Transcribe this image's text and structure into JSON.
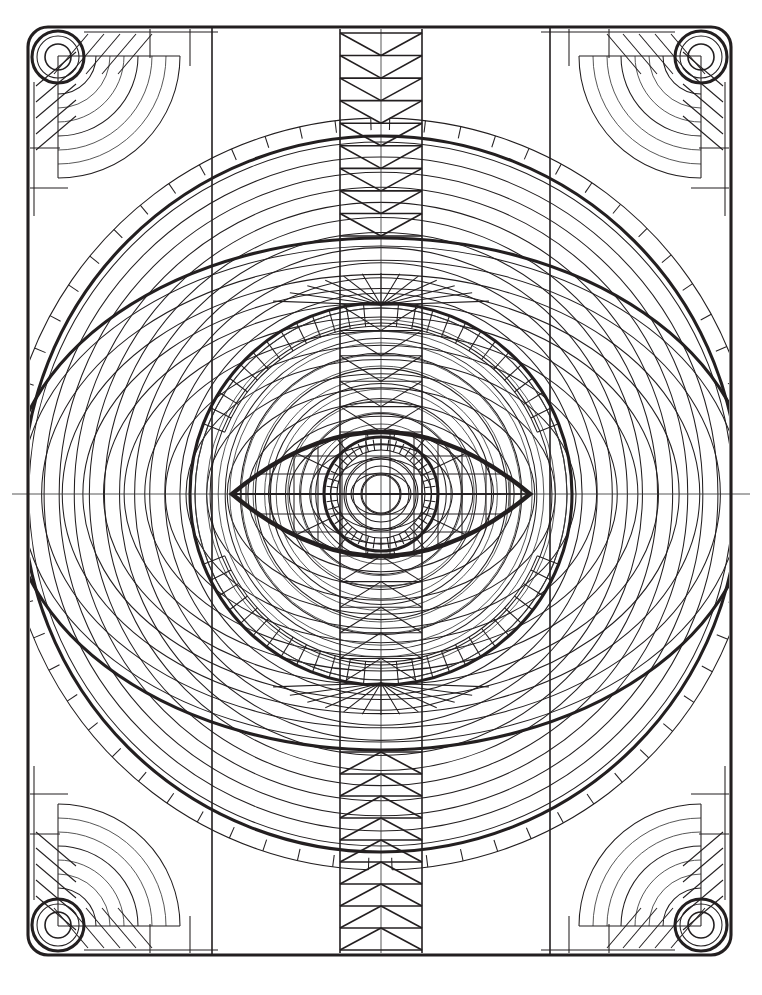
{
  "artwork": {
    "title": "Symmetric Eye Mandala Line Drawing",
    "kind": "coloring-page-line-art",
    "canvas": {
      "width": 762,
      "height": 995,
      "background": "#ffffff"
    },
    "ink": {
      "line_color": "#231f20",
      "fill": "none"
    }
  },
  "geometry": {
    "center": {
      "x": 381,
      "y": 494
    },
    "frame": {
      "name": "rounded-rectangle-frame",
      "x": 28,
      "y": 27,
      "width": 703,
      "height": 928,
      "corner_radius": 20,
      "stroke_width": 3.1,
      "inner_panel_lines_x": [
        212,
        550
      ],
      "panel_line_stroke": 1.6
    },
    "corner_bolts": {
      "name": "corner-bolt-rings",
      "outer_radius": 26,
      "mid_radius": 21,
      "inner_radius": 13,
      "positions": [
        {
          "x": 58,
          "y": 57
        },
        {
          "x": 701,
          "y": 57
        },
        {
          "x": 58,
          "y": 925
        },
        {
          "x": 701,
          "y": 925
        }
      ]
    },
    "corner_decor": {
      "name": "corner-quarter-arc-fan",
      "arc_radii": [
        38,
        52,
        66,
        80,
        94,
        108,
        122
      ],
      "ladder_rungs": 13,
      "ladder_inner_offset": 6,
      "ladder_outer_offset": 18,
      "hatch_lines": 5
    },
    "big_circle": {
      "name": "outer-great-circle",
      "cx": 381,
      "cy": 494,
      "r": 358,
      "stroke_width": 3.1
    },
    "concentric_rings": {
      "name": "concentric-ring-family",
      "count": 23,
      "r_min": 20,
      "r_max": 352,
      "stroke_width": 1.05
    },
    "ellipse": {
      "name": "horizontal-great-ellipse",
      "cx": 381,
      "cy": 494,
      "rx": 372,
      "ry": 256,
      "stroke_width": 3.1
    },
    "ellipse_rings": {
      "name": "concentric-ellipse-family",
      "count": 17,
      "rx_min": 30,
      "ry_min": 21,
      "rx_max": 360,
      "ry_max": 248,
      "stroke_width": 1.05
    },
    "mid_circle": {
      "name": "inner-mid-circle",
      "cx": 381,
      "cy": 494,
      "r": 191,
      "stroke_width": 3.1
    },
    "mid_circle_rings": {
      "name": "inner-circle-ring-family",
      "count": 11,
      "r_min": 70,
      "r_max": 186,
      "stroke_width": 1.05
    },
    "eye": {
      "name": "central-eye-lens",
      "left_x": 232,
      "right_x": 530,
      "cy": 494,
      "half_height": 62,
      "stroke_width": 4.4,
      "lash_rays": 9
    },
    "iris": {
      "name": "iris-rings",
      "cx": 381,
      "cy": 494,
      "outer_r": 57,
      "tick_inner_r": 44,
      "tick_count": 44,
      "ring_radii": [
        37,
        28,
        19
      ],
      "outer_stroke": 4.0
    },
    "vertical_band": {
      "name": "central-vertical-chevron-band",
      "left_x": 340,
      "right_x": 422,
      "top_y": 27,
      "bottom_y": 955,
      "chevron_rows_top": 9,
      "chevron_rows_bottom": 9,
      "stroke_width": 1.6
    },
    "fan_bands": {
      "name": "radial-fan-bands",
      "top_band": {
        "outer_r": 191,
        "inner_r": 168,
        "spokes": 26
      },
      "bottom_band": {
        "outer_r": 191,
        "inner_r": 168,
        "spokes": 26
      }
    },
    "axis_lines": {
      "name": "horizontal-axis-rule",
      "y": 494,
      "x_from": 12,
      "x_to": 750,
      "stroke_width": 0.85
    }
  }
}
